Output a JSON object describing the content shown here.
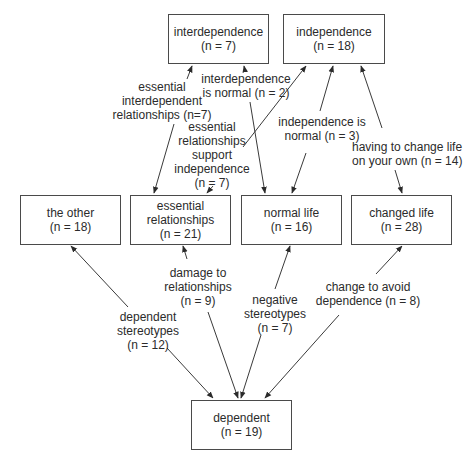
{
  "diagram": {
    "type": "concept-map",
    "colors": {
      "background": "#ffffff",
      "box_border": "#4a4a4a",
      "line": "#3a3a3a",
      "text": "#2b2b2b"
    },
    "nodes": [
      {
        "id": "interdependence",
        "title": "interdependence",
        "count": "(n = 7)"
      },
      {
        "id": "independence",
        "title": "independence",
        "count": "(n = 18)"
      },
      {
        "id": "the_other",
        "title": "the other",
        "count": "(n = 18)"
      },
      {
        "id": "essential_relationships",
        "title_line1": "essential",
        "title_line2": "relationships",
        "count": "(n = 21)"
      },
      {
        "id": "normal_life",
        "title": "normal life",
        "count": "(n = 16)"
      },
      {
        "id": "changed_life",
        "title": "changed life",
        "count": "(n = 28)"
      },
      {
        "id": "dependent",
        "title": "dependent",
        "count": "(n = 19)"
      }
    ],
    "edges": [
      {
        "from": "essential_relationships",
        "to": "interdependence",
        "lines": [
          "essential",
          "interdependent",
          "relationships (n=7)"
        ]
      },
      {
        "from": "interdependence",
        "to": "normal_life",
        "lines": [
          "interdependence",
          "is normal (n = 2)"
        ]
      },
      {
        "from": "essential_relationships",
        "to": "independence",
        "lines": [
          "essential",
          "relationships",
          "support",
          "independence",
          "(n = 7)"
        ]
      },
      {
        "from": "independence",
        "to": "normal_life",
        "lines": [
          "independence is",
          "normal (n = 3)"
        ]
      },
      {
        "from": "independence",
        "to": "changed_life",
        "lines": [
          "having to change life",
          "on your own (n = 14)"
        ]
      },
      {
        "from": "the_other",
        "to": "dependent",
        "lines": [
          "dependent",
          "stereotypes",
          "(n = 12)"
        ]
      },
      {
        "from": "essential_relationships",
        "to": "dependent",
        "lines": [
          "damage to",
          "relationships",
          "(n = 9)"
        ]
      },
      {
        "from": "normal_life",
        "to": "dependent",
        "lines": [
          "negative",
          "stereotypes",
          "(n = 7)"
        ]
      },
      {
        "from": "changed_life",
        "to": "dependent",
        "lines": [
          "change to avoid",
          "dependence (n = 8)"
        ]
      }
    ]
  }
}
